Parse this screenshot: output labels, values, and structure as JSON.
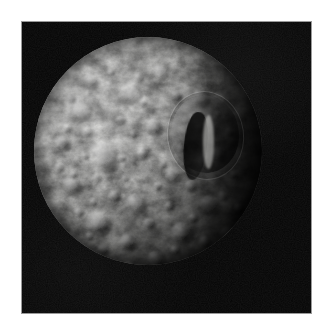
{
  "page": {
    "background_color": "#ffffff",
    "width": 325,
    "height": 328
  },
  "figure": {
    "name": "mimas-photograph",
    "alt_text": "Grayscale spacecraft photograph of Saturn's moon Mimas against black space",
    "subject": "Mimas",
    "frame": {
      "x": 21,
      "y": 21,
      "width": 291,
      "height": 293,
      "border_color": "#9a9a9a",
      "background_color": "#040404"
    },
    "body": {
      "name": "moon-disc",
      "center_x": 147,
      "center_y": 150,
      "diameter": 228,
      "surface_description": "heavily cratered icy surface",
      "bright_color": "#d8d8d6",
      "mid_color": "#a9a9a7",
      "shadow_color": "#141414",
      "illumination_direction": "upper-left",
      "terminator_side": "right"
    },
    "features": [
      {
        "name": "herschel-crater",
        "label": "Herschel",
        "relative_x": 0.72,
        "relative_y": 0.42,
        "relative_size": 0.31,
        "description": "large impact crater with prominent shadowed central peak"
      },
      {
        "name": "dark-limb",
        "label": "shadowed limb",
        "relative_x": 0.93,
        "relative_y": 0.52,
        "description": "darkened right-hand limb approaching the terminator"
      }
    ]
  }
}
